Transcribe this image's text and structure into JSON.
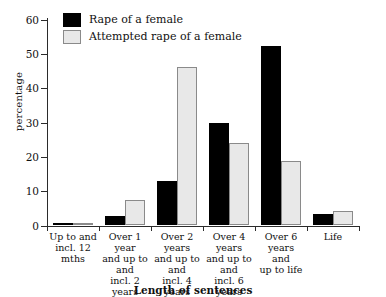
{
  "chart_data": {
    "type": "bar",
    "title": "",
    "xlabel": "Length of sentences",
    "ylabel": "percentage",
    "ylim": [
      0,
      60
    ],
    "yticks": [
      0,
      10,
      20,
      30,
      40,
      50,
      60
    ],
    "grid": false,
    "legend_position": "top-left",
    "categories": [
      "Up to and\nincl. 12 mths",
      "Over 1 year\nand up to\nand\nincl. 2 years",
      "Over 2 years\nand up to\nand\nincl. 4 years",
      "Over 4 years\nand up to\nand\nincl. 6 years",
      "Over 6 years\nand\nup to life",
      "Life"
    ],
    "category_lines": [
      [
        "Up to and",
        "incl. 12 mths"
      ],
      [
        "Over 1 year",
        "and up to",
        "and",
        "incl. 2 years"
      ],
      [
        "Over 2 years",
        "and up to",
        "and",
        "incl. 4 years"
      ],
      [
        "Over 4 years",
        "and up to",
        "and",
        "incl. 6 years"
      ],
      [
        "Over 6 years",
        "and",
        "up to life"
      ],
      [
        "Life"
      ]
    ],
    "series": [
      {
        "name": "Rape of a female",
        "color": "#000000",
        "values": [
          0.3,
          2.5,
          12.8,
          29.8,
          52.5,
          3.3
        ]
      },
      {
        "name": "Attempted rape of a female",
        "color": "#e8e8e8",
        "values": [
          0.3,
          7.4,
          46.3,
          24.0,
          18.6,
          4.2
        ]
      }
    ]
  },
  "legend": {
    "items": [
      {
        "label": "Rape of a female",
        "swatch": "dark"
      },
      {
        "label": "Attempted rape of a female",
        "swatch": "light"
      }
    ]
  },
  "axes": {
    "y_title": "percentage",
    "x_title": "Length of sentences",
    "y_tick_labels": [
      "60",
      "50",
      "40",
      "30",
      "20",
      "10",
      "0"
    ]
  }
}
